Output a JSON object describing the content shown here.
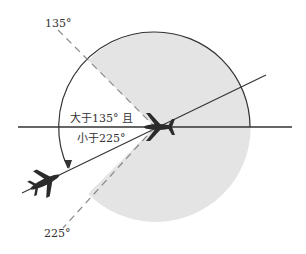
{
  "labels": {
    "angle_135": "135°",
    "angle_225": "225°",
    "range_line1": "大于135° 且",
    "range_line2": "小于225°"
  },
  "colors": {
    "shade": "#e4e4e4",
    "line": "#333333",
    "dashed": "#888888",
    "plane": "#2b2b2b"
  }
}
